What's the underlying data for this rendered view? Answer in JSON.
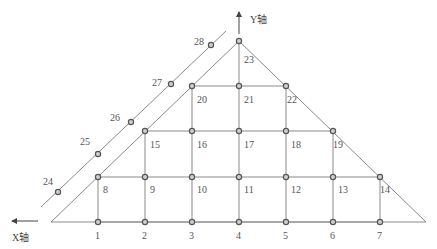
{
  "colors": {
    "line": "#8a8a8a",
    "node_stroke": "#555555",
    "node_fill": "#cfcfcf",
    "text": "#555555"
  },
  "axes": {
    "x_label": "X轴",
    "y_label": "Y轴"
  },
  "shape": {
    "outline": [
      [
        51,
        222
      ],
      [
        239,
        41
      ],
      [
        426,
        222
      ]
    ],
    "outer_line": [
      [
        41,
        207
      ],
      [
        226,
        31
      ]
    ]
  },
  "nodes": [
    {
      "id": "1",
      "x": 98,
      "y": 222,
      "lx": 95,
      "ly": 239
    },
    {
      "id": "2",
      "x": 145,
      "y": 222,
      "lx": 142,
      "ly": 239
    },
    {
      "id": "3",
      "x": 192,
      "y": 222,
      "lx": 189,
      "ly": 239
    },
    {
      "id": "4",
      "x": 239,
      "y": 222,
      "lx": 236,
      "ly": 239
    },
    {
      "id": "5",
      "x": 286,
      "y": 222,
      "lx": 283,
      "ly": 239
    },
    {
      "id": "6",
      "x": 333,
      "y": 222,
      "lx": 330,
      "ly": 239
    },
    {
      "id": "7",
      "x": 380,
      "y": 222,
      "lx": 377,
      "ly": 239
    },
    {
      "id": "8",
      "x": 98,
      "y": 177,
      "lx": 103,
      "ly": 193
    },
    {
      "id": "9",
      "x": 145,
      "y": 177,
      "lx": 150,
      "ly": 193
    },
    {
      "id": "10",
      "x": 192,
      "y": 177,
      "lx": 197,
      "ly": 193
    },
    {
      "id": "11",
      "x": 239,
      "y": 177,
      "lx": 244,
      "ly": 193
    },
    {
      "id": "12",
      "x": 286,
      "y": 177,
      "lx": 291,
      "ly": 193
    },
    {
      "id": "13",
      "x": 333,
      "y": 177,
      "lx": 338,
      "ly": 193
    },
    {
      "id": "14",
      "x": 380,
      "y": 177,
      "lx": 380,
      "ly": 193
    },
    {
      "id": "15",
      "x": 145,
      "y": 131,
      "lx": 150,
      "ly": 148
    },
    {
      "id": "16",
      "x": 192,
      "y": 131,
      "lx": 197,
      "ly": 148
    },
    {
      "id": "17",
      "x": 239,
      "y": 131,
      "lx": 244,
      "ly": 148
    },
    {
      "id": "18",
      "x": 286,
      "y": 131,
      "lx": 291,
      "ly": 148
    },
    {
      "id": "19",
      "x": 333,
      "y": 131,
      "lx": 333,
      "ly": 148
    },
    {
      "id": "20",
      "x": 192,
      "y": 86,
      "lx": 197,
      "ly": 103
    },
    {
      "id": "21",
      "x": 239,
      "y": 86,
      "lx": 244,
      "ly": 103
    },
    {
      "id": "22",
      "x": 286,
      "y": 86,
      "lx": 287,
      "ly": 103
    },
    {
      "id": "23",
      "x": 239,
      "y": 41,
      "lx": 244,
      "ly": 63
    },
    {
      "id": "24",
      "x": 58,
      "y": 192,
      "lx": 43,
      "ly": 185
    },
    {
      "id": "25",
      "x": 98,
      "y": 154,
      "lx": 80,
      "ly": 145
    },
    {
      "id": "26",
      "x": 131,
      "y": 122,
      "lx": 110,
      "ly": 121
    },
    {
      "id": "27",
      "x": 171,
      "y": 84,
      "lx": 152,
      "ly": 86
    },
    {
      "id": "28",
      "x": 211,
      "y": 45,
      "lx": 194,
      "ly": 45
    }
  ],
  "edges": [
    [
      [
        98,
        222
      ],
      [
        380,
        222
      ]
    ],
    [
      [
        98,
        177
      ],
      [
        380,
        177
      ]
    ],
    [
      [
        145,
        131
      ],
      [
        333,
        131
      ]
    ],
    [
      [
        192,
        86
      ],
      [
        286,
        86
      ]
    ],
    [
      [
        98,
        222
      ],
      [
        98,
        177
      ]
    ],
    [
      [
        145,
        222
      ],
      [
        145,
        131
      ]
    ],
    [
      [
        192,
        222
      ],
      [
        192,
        86
      ]
    ],
    [
      [
        239,
        222
      ],
      [
        239,
        41
      ]
    ],
    [
      [
        286,
        222
      ],
      [
        286,
        86
      ]
    ],
    [
      [
        333,
        222
      ],
      [
        333,
        131
      ]
    ],
    [
      [
        380,
        222
      ],
      [
        380,
        177
      ]
    ]
  ]
}
